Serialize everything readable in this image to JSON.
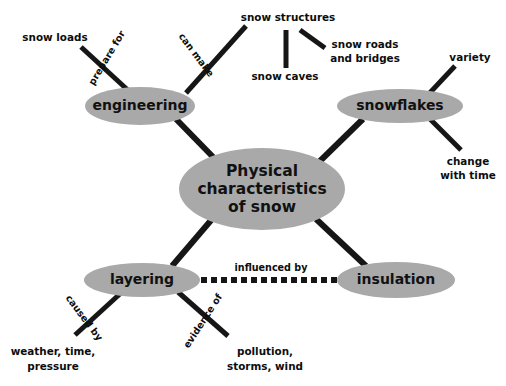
{
  "diagram": {
    "background_color": "#ffffff",
    "node_fill_color": "#a9a9a9",
    "connector_color": "#161616",
    "text_color": "#0d0d0d"
  },
  "nodes": {
    "center": {
      "label_line1": "Physical",
      "label_line2": "characteristics",
      "label_line3": "of snow",
      "cx": 262,
      "cy": 189,
      "rx": 83,
      "ry": 41
    },
    "engineering": {
      "label": "engineering",
      "cx": 140,
      "cy": 106,
      "rx": 55,
      "ry": 19
    },
    "snowflakes": {
      "label": "snowflakes",
      "cx": 400,
      "cy": 106,
      "rx": 63,
      "ry": 17
    },
    "layering": {
      "label": "layering",
      "cx": 142,
      "cy": 280,
      "rx": 58,
      "ry": 17
    },
    "insulation": {
      "label": "insulation",
      "cx": 396,
      "cy": 280,
      "rx": 59,
      "ry": 18
    }
  },
  "leaves": {
    "snow_loads": {
      "label": "snow loads",
      "x": 55,
      "y": 38
    },
    "snow_structures": {
      "label": "snow structures",
      "x": 288,
      "y": 18
    },
    "snow_caves": {
      "label": "snow caves",
      "x": 285,
      "y": 77
    },
    "snow_roads_bridges": {
      "line1": "snow roads",
      "line2": "and bridges",
      "x": 365,
      "y": 45
    },
    "variety": {
      "label": "variety",
      "x": 470,
      "y": 58
    },
    "change_with_time": {
      "line1": "change",
      "line2": "change",
      "line1_text": "change",
      "line2_text": "with time",
      "x": 468,
      "y": 162
    },
    "weather_time_pressure": {
      "line1": "weather, time,",
      "line2": "pressure",
      "x": 53,
      "y": 352
    },
    "pollution_storms_wind": {
      "line1": "pollution,",
      "line2": "storms, wind",
      "x": 265,
      "y": 352
    }
  },
  "link_labels": {
    "prepare_for": {
      "label": "prepare for",
      "x": 107,
      "y": 58,
      "rotation": -59
    },
    "can_make": {
      "label": "can make",
      "x": 196,
      "y": 55,
      "rotation": 53
    },
    "caused_by": {
      "label": "caused by",
      "x": 84,
      "y": 318,
      "rotation": 53
    },
    "evidence_of": {
      "label": "evidence of",
      "x": 203,
      "y": 321,
      "rotation": -57
    },
    "influenced_by": {
      "label": "influenced by",
      "x": 271,
      "y": 268,
      "rotation": 0
    }
  },
  "connectors": [
    {
      "name": "engineering-to-snow-loads",
      "x1": 81,
      "y1": 47,
      "x2": 131,
      "y2": 93,
      "width": 5,
      "style": "solid"
    },
    {
      "name": "engineering-to-snow-structures",
      "x1": 246,
      "y1": 26,
      "x2": 186,
      "y2": 93,
      "width": 5,
      "style": "solid"
    },
    {
      "name": "engineering-to-center",
      "x1": 176,
      "y1": 119,
      "x2": 215,
      "y2": 159,
      "width": 6,
      "style": "solid"
    },
    {
      "name": "snow-structures-to-snow-caves",
      "x1": 286,
      "y1": 30,
      "x2": 286,
      "y2": 68,
      "width": 5,
      "style": "solid"
    },
    {
      "name": "snow-structures-to-snow-roads",
      "x1": 300,
      "y1": 30,
      "x2": 325,
      "y2": 48,
      "width": 5,
      "style": "solid"
    },
    {
      "name": "snowflakes-to-variety",
      "x1": 455,
      "y1": 66,
      "x2": 425,
      "y2": 98,
      "width": 5,
      "style": "solid"
    },
    {
      "name": "snowflakes-to-change-with-time",
      "x1": 461,
      "y1": 150,
      "x2": 428,
      "y2": 117,
      "width": 5,
      "style": "solid"
    },
    {
      "name": "snowflakes-to-center",
      "x1": 363,
      "y1": 119,
      "x2": 319,
      "y2": 162,
      "width": 6,
      "style": "solid"
    },
    {
      "name": "center-to-layering",
      "x1": 213,
      "y1": 218,
      "x2": 172,
      "y2": 266,
      "width": 6,
      "style": "solid"
    },
    {
      "name": "center-to-insulation",
      "x1": 316,
      "y1": 219,
      "x2": 366,
      "y2": 266,
      "width": 6,
      "style": "solid"
    },
    {
      "name": "layering-to-weather",
      "x1": 75,
      "y1": 335,
      "x2": 122,
      "y2": 292,
      "width": 5,
      "style": "solid"
    },
    {
      "name": "layering-to-pollution",
      "x1": 228,
      "y1": 336,
      "x2": 178,
      "y2": 292,
      "width": 5,
      "style": "solid"
    },
    {
      "name": "layering-to-insulation",
      "x1": 201,
      "y1": 280,
      "x2": 339,
      "y2": 280,
      "width": 6,
      "style": "dashed"
    }
  ]
}
